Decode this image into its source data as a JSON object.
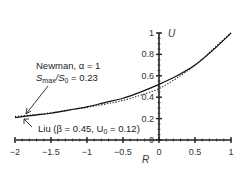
{
  "chart_data": {
    "type": "line",
    "title": "",
    "xlabel": "R",
    "ylabel": "U",
    "xlim": [
      -2,
      1
    ],
    "ylim": [
      0,
      1
    ],
    "x_ticks": [
      "-2",
      "-1.5",
      "-1",
      "-0.5",
      "0",
      "0.5",
      "1"
    ],
    "y_ticks": [
      "0",
      "0.2",
      "0.4",
      "0.6",
      "0.8",
      "1"
    ],
    "grid": false,
    "axes_style": "crossed at origin (y-axis at R=0)",
    "series": [
      {
        "name": "Newman, α = 1, Smax/S0 = 0.23",
        "style": "solid",
        "x": [
          -2,
          -1.75,
          -1.5,
          -1.25,
          -1,
          -0.75,
          -0.5,
          -0.25,
          0,
          0.25,
          0.5,
          0.75,
          1
        ],
        "y": [
          0.21,
          0.23,
          0.25,
          0.28,
          0.31,
          0.35,
          0.39,
          0.45,
          0.52,
          0.6,
          0.7,
          0.84,
          1.0
        ]
      },
      {
        "name": "Liu (β = 0.45, U0 = 0.12)",
        "style": "dotted",
        "x": [
          -2,
          -1.75,
          -1.5,
          -1.25,
          -1,
          -0.75,
          -0.5,
          -0.25,
          0,
          0.25,
          0.5,
          0.75,
          1
        ],
        "y": [
          0.22,
          0.235,
          0.255,
          0.28,
          0.305,
          0.335,
          0.37,
          0.42,
          0.48,
          0.58,
          0.7,
          0.85,
          1.0
        ]
      }
    ],
    "annotations": [
      {
        "text_line1": "Newman, α = 1",
        "text_line2": "Smax/S0 = 0.23",
        "points_to": "solid curve near R=-1.9"
      },
      {
        "text": "Liu (β = 0.45, U0 = 0.12)",
        "points_to": "dotted curve near R=-1.9"
      }
    ]
  },
  "labels": {
    "x_axis": "R",
    "y_axis": "U",
    "newman_line1": "Newman, α = 1",
    "newman_line2_a": "S",
    "newman_line2_sub1": "max",
    "newman_line2_b": "/S",
    "newman_line2_sub2": "0",
    "newman_line2_c": " = 0.23",
    "liu_a": "Liu (β = 0.45, U",
    "liu_sub": "0",
    "liu_b": " = 0.12)"
  }
}
